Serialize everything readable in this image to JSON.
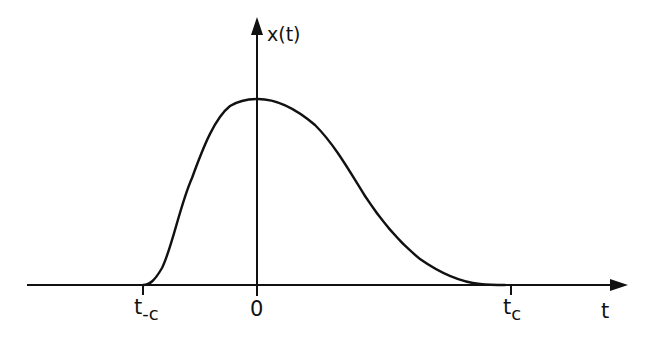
{
  "diagram": {
    "type": "signal-pulse",
    "colors": {
      "ink": "#111111",
      "background": "#ffffff"
    },
    "axes": {
      "horizontal_label": "t",
      "vertical_label": "x(t)"
    },
    "ticks": [
      {
        "id": "t_neg_c",
        "base": "t",
        "sub": "-c"
      },
      {
        "id": "zero",
        "base": "0",
        "sub": ""
      },
      {
        "id": "t_c",
        "base": "t",
        "sub": "c"
      }
    ],
    "curve": {
      "description": "Smooth, asymmetric single-peaked pulse that is zero outside [t_-c, t_c], peaking just after t = 0"
    }
  }
}
